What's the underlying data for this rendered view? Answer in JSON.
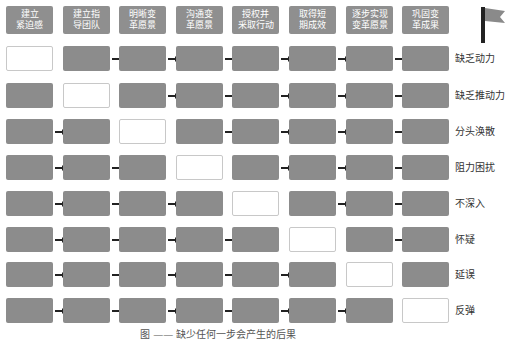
{
  "headers": [
    "建立\n紧迫感",
    "建立指\n导团队",
    "明晰变\n革愿景",
    "沟通变\n革愿景",
    "授权并\n采取行动",
    "取得短\n期成效",
    "逐步实现\n变革愿景",
    "巩固变\n革成果"
  ],
  "rows": [
    {
      "label": "缺乏动力",
      "missing_step": 1
    },
    {
      "label": "缺乏推动力",
      "missing_step": 2
    },
    {
      "label": "分头涣散",
      "missing_step": 3
    },
    {
      "label": "阻力困扰",
      "missing_step": 4
    },
    {
      "label": "不深入",
      "missing_step": 5
    },
    {
      "label": "怀疑",
      "missing_step": 6
    },
    {
      "label": "延误",
      "missing_step": 7
    },
    {
      "label": "反弹",
      "missing_step": 8
    }
  ],
  "colors": {
    "step_filled": "#8c8c8c",
    "step_missing": "#ffffff",
    "header": "#8f8f8f",
    "flag": "#8a8a8a",
    "pole": "#222222"
  },
  "icons": {
    "goal": "flag-icon"
  },
  "caption": "图 —— 缺少任何一步会产生的后果"
}
